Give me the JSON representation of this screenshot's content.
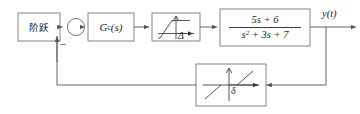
{
  "diagram": {
    "type": "control-system-block-diagram",
    "width": 360,
    "height": 114,
    "background": "#ffffff",
    "line_color": "#555555",
    "text_color": "#1a1a1a"
  },
  "source_block": {
    "label": "阶跃",
    "meaning": "step input"
  },
  "summing_junction": {
    "positive_sign": "",
    "negative_sign": "−"
  },
  "controller_block": {
    "name": "G",
    "subscript": "c",
    "argument": "(s)",
    "full_label": "G_c(s)"
  },
  "saturation_block": {
    "label": "Δ",
    "kind": "saturation-nonlinearity"
  },
  "plant_block": {
    "numerator": "5s + 6",
    "denominator_base": "s",
    "denominator_exponent": "2",
    "denominator_rest": " + 3s + 7",
    "transfer_function": "(5s + 6) / (s^2 + 3s + 7)"
  },
  "feedback_block": {
    "label": "δ",
    "kind": "dead-zone-nonlinearity"
  },
  "output": {
    "label": "y(t)"
  }
}
